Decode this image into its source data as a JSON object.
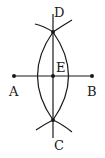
{
  "diagram": {
    "labels": {
      "A": "A",
      "B": "B",
      "C": "C",
      "D": "D",
      "E": "E"
    },
    "colors": {
      "stroke": "#1a1a1a",
      "background": "#ffffff"
    }
  }
}
